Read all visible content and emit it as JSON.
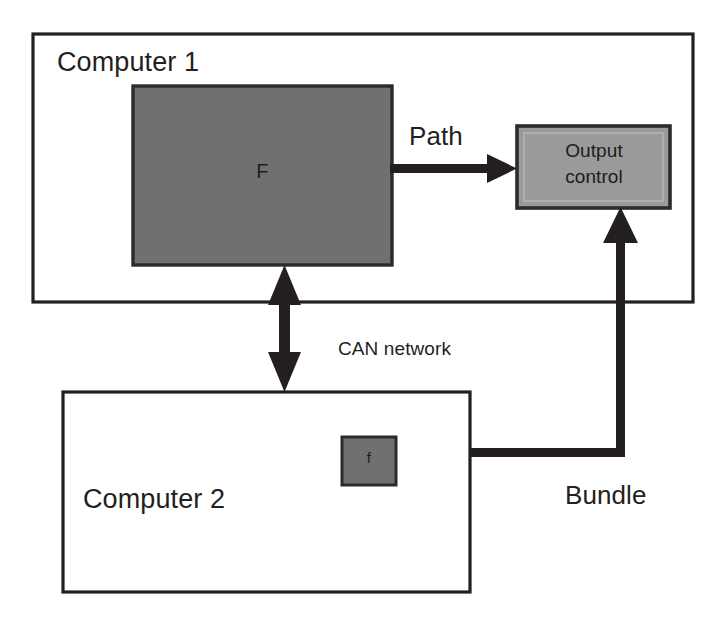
{
  "diagram": {
    "colors": {
      "stroke": "#231f20",
      "function_block_fill": "#707070",
      "output_block_fill": "#9a9a9a",
      "background": "#ffffff"
    },
    "containers": [
      {
        "id": "computer1",
        "label": "Computer 1",
        "x": 33,
        "y": 34,
        "width": 660,
        "height": 268
      },
      {
        "id": "computer2",
        "label": "Computer 2",
        "x": 63,
        "y": 392,
        "width": 407,
        "height": 200
      }
    ],
    "blocks": [
      {
        "id": "function-f",
        "label": "F",
        "fill": "#707070",
        "x": 133,
        "y": 86,
        "width": 259,
        "height": 179
      },
      {
        "id": "output-control",
        "label_line1": "Output",
        "label_line2": "control",
        "fill": "#9a9a9a",
        "x": 517,
        "y": 126,
        "width": 153,
        "height": 82
      },
      {
        "id": "function-f-small",
        "label": "f",
        "fill": "#707070",
        "x": 342,
        "y": 437,
        "width": 54,
        "height": 48
      }
    ],
    "connectors": [
      {
        "id": "path-arrow",
        "label": "Path",
        "from": "function-f",
        "to": "output-control",
        "style": "single-arrow-right"
      },
      {
        "id": "can-network-arrow",
        "label": "CAN network",
        "from": "computer1",
        "to": "computer2",
        "style": "double-arrow-vertical"
      },
      {
        "id": "bundle-arrow",
        "label": "Bundle",
        "from": "function-f-small",
        "to": "output-control",
        "style": "elbow-arrow-up"
      }
    ]
  }
}
